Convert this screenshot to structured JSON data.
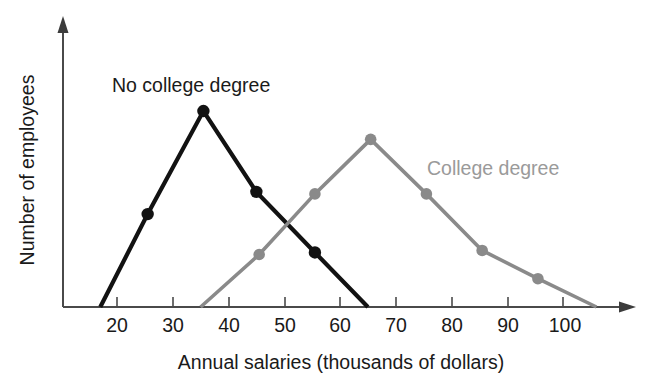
{
  "chart_data": {
    "type": "line",
    "title": "",
    "subtitle": "",
    "xlabel": "Annual salaries (thousands of dollars)",
    "ylabel": "Number of employees",
    "xlim": [
      10,
      112
    ],
    "ylim": [
      0,
      100
    ],
    "grid": false,
    "legend_position": "inline-annotation",
    "xticks": [
      20,
      30,
      40,
      50,
      60,
      70,
      80,
      90,
      100
    ],
    "xtick_labels": [
      "20",
      "30",
      "40",
      "50",
      "60",
      "70",
      "80",
      "90",
      "100"
    ],
    "yticks": [],
    "ytick_labels": [],
    "series": [
      {
        "name": "No college degree",
        "color": "#121212",
        "marker": "circle",
        "linewidth": 4.2,
        "x": [
          17,
          25.5,
          35.5,
          45,
          55.5,
          65
        ],
        "y": [
          0,
          46,
          97,
          57,
          27,
          0
        ],
        "markers_shown": [
          false,
          true,
          true,
          true,
          true,
          false
        ]
      },
      {
        "name": "College degree",
        "color": "#8a8a8a",
        "marker": "circle",
        "linewidth": 3.6,
        "x": [
          35,
          45.5,
          55.5,
          65.5,
          75.5,
          85.5,
          95.5,
          106
        ],
        "y": [
          0,
          26,
          56,
          83,
          56,
          28,
          14,
          0
        ],
        "markers_shown": [
          false,
          true,
          true,
          true,
          true,
          true,
          true,
          false
        ]
      }
    ],
    "annotations": [
      {
        "text": "No college degree",
        "x_px": 112,
        "y_px": 92,
        "color": "#1a1a1a"
      },
      {
        "text": "College degree",
        "x_px": 427,
        "y_px": 175,
        "color": "#9a9a9a"
      }
    ]
  },
  "axes": {
    "x_axis_name": "Annual salaries (thousands of dollars)",
    "y_axis_name": "Number of employees",
    "x_arrow": true,
    "y_arrow": true
  },
  "colors": {
    "no_college_degree": "#121212",
    "college_degree": "#8a8a8a",
    "axis": "#4a4a4a",
    "background": "#ffffff",
    "text": "#1a1a1a"
  }
}
